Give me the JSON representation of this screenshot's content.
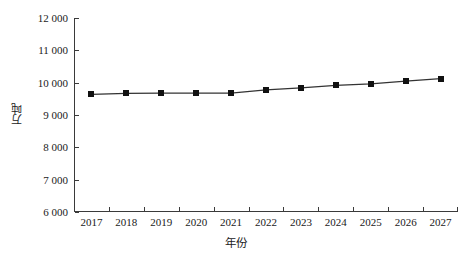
{
  "chart_data": {
    "type": "line",
    "title": "",
    "xlabel": "年份",
    "ylabel": "万吨",
    "categories": [
      "2017",
      "2018",
      "2019",
      "2020",
      "2021",
      "2022",
      "2023",
      "2024",
      "2025",
      "2026",
      "2027"
    ],
    "values": [
      9640,
      9670,
      9675,
      9675,
      9675,
      9780,
      9840,
      9915,
      9965,
      10050,
      10125
    ],
    "series": [
      {
        "name": "",
        "values": [
          9640,
          9670,
          9675,
          9675,
          9675,
          9780,
          9840,
          9915,
          9965,
          10050,
          10125
        ],
        "marker": "square",
        "color": "#111111"
      }
    ],
    "ylim": [
      6000,
      12000
    ],
    "ytick_values": [
      6000,
      7000,
      8000,
      9000,
      10000,
      11000,
      12000
    ],
    "ytick_labels": [
      "6 000",
      "7 000",
      "8 000",
      "9 000",
      "10 000",
      "11 000",
      "12 000"
    ],
    "xtick_labels": [
      "2017",
      "2018",
      "2019",
      "2020",
      "2021",
      "2022",
      "2023",
      "2024",
      "2025",
      "2026",
      "2027"
    ],
    "grid": false,
    "legend": false,
    "legend_position": "none",
    "axis_color": "#3a3a3a",
    "line_color": "#333333",
    "marker_color": "#111111",
    "background": "#ffffff"
  }
}
